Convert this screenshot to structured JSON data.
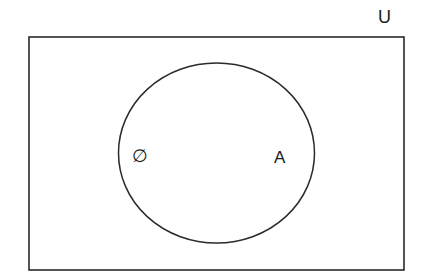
{
  "diagram": {
    "type": "venn",
    "universe_label": "U",
    "sets": [
      {
        "label": "A",
        "contains": [
          "∅"
        ]
      }
    ],
    "empty_set_label": "∅",
    "stroke_color": "#2a2a2a",
    "background": "#ffffff"
  }
}
